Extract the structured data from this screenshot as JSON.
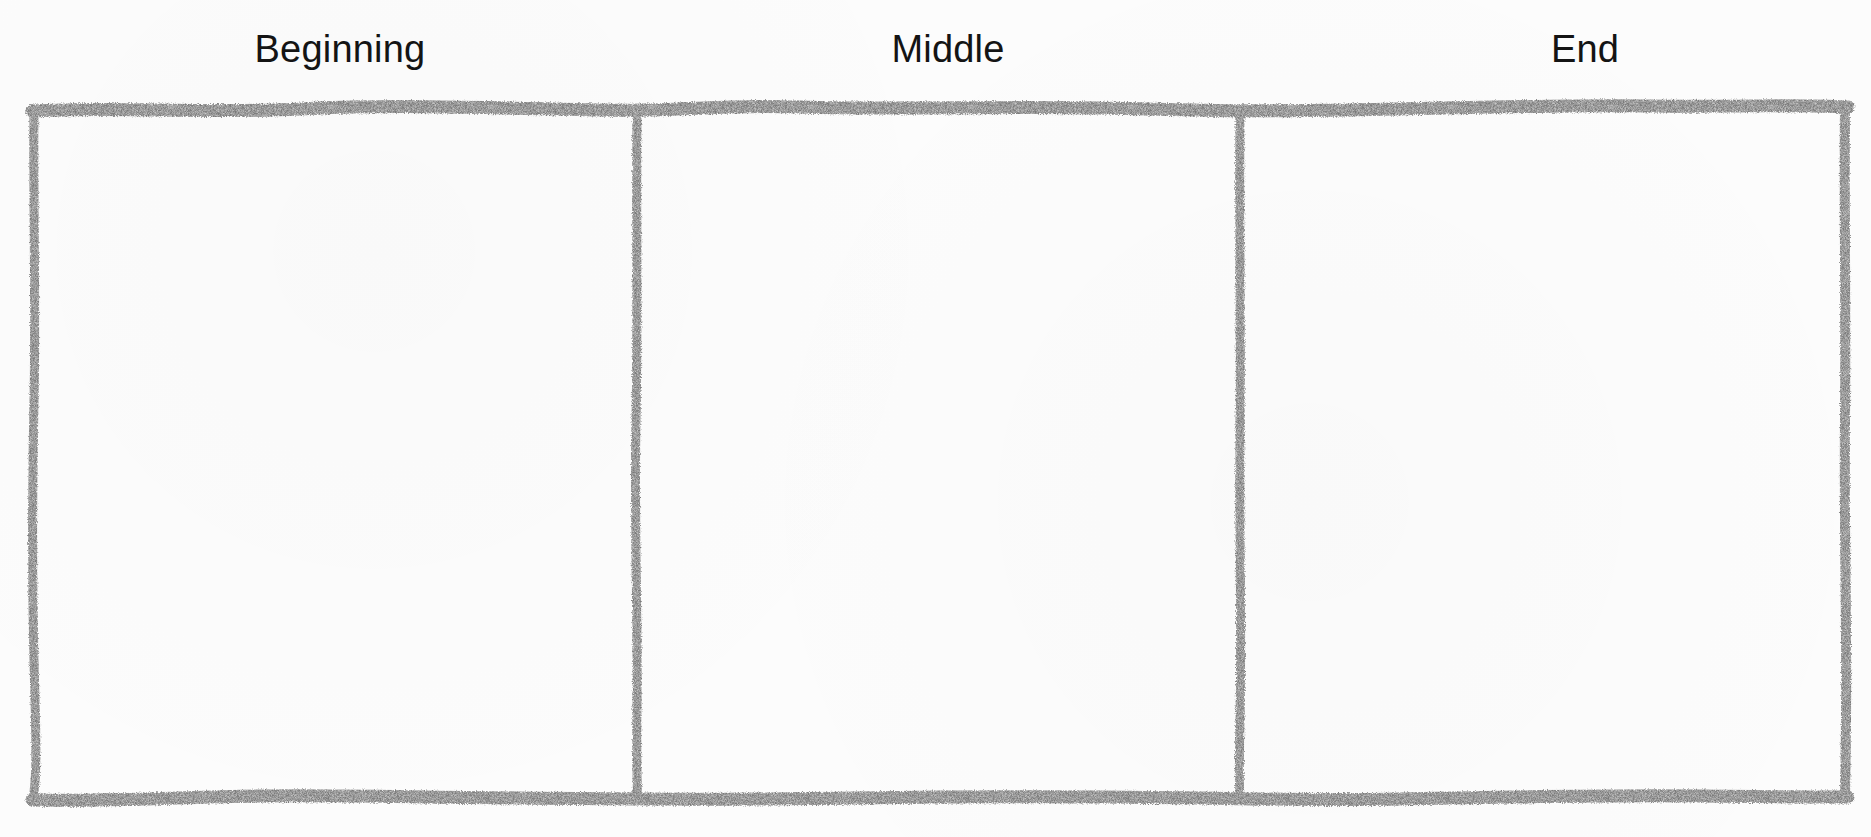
{
  "worksheet": {
    "columns": [
      {
        "label": "Beginning",
        "content": ""
      },
      {
        "label": "Middle",
        "content": ""
      },
      {
        "label": "End",
        "content": ""
      }
    ]
  },
  "colors": {
    "border": "#7a7a7a",
    "text": "#141414",
    "background": "#fcfcfc"
  }
}
